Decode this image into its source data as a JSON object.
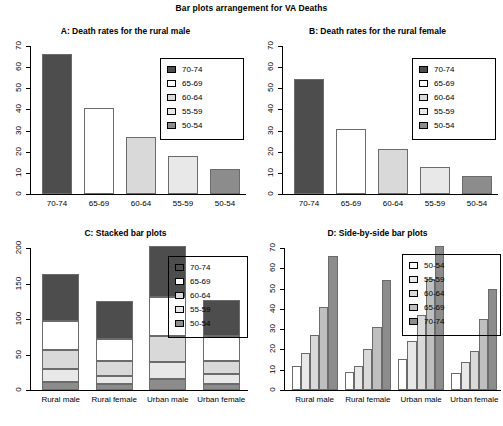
{
  "figure": {
    "title": "Bar plots arrangement for VA Deaths"
  },
  "groups": [
    "Rural male",
    "Rural female",
    "Urban male",
    "Urban female"
  ],
  "age_groups": [
    "70-74",
    "65-69",
    "60-64",
    "55-59",
    "50-54"
  ],
  "colors": {
    "70-74": "#4d4d4d",
    "65-69": "#ffffff",
    "60-64": "#d9d9d9",
    "55-59": "#e8e8e8",
    "50-54": "#8c8c8c",
    "d_50-54": "#ffffff",
    "d_55-59": "#e8e8e8",
    "d_60-64": "#d9d9d9",
    "d_65-69": "#bfbfbf",
    "d_70-74": "#8c8c8c",
    "border": "#6b6b6b",
    "axis": "#000000"
  },
  "panels": {
    "A": {
      "title": "A: Death rates for the rural male",
      "legend_items": [
        "70-74",
        "65-69",
        "60-64",
        "55-59",
        "50-54"
      ]
    },
    "B": {
      "title": "B: Death rates for the rural female",
      "legend_items": [
        "70-74",
        "65-69",
        "60-64",
        "55-59",
        "50-54"
      ]
    },
    "C": {
      "title": "C: Stacked bar plots",
      "legend_items": [
        "70-74",
        "65-69",
        "60-64",
        "55-59",
        "50-54"
      ]
    },
    "D": {
      "title": "D: Side-by-side bar plots",
      "legend_items": [
        "50-54",
        "55-59",
        "60-64",
        "65-69",
        "70-74"
      ]
    }
  },
  "chart_data": [
    {
      "type": "bar",
      "panel": "A",
      "title": "A: Death rates for the rural male",
      "categories": [
        "70-74",
        "65-69",
        "60-64",
        "55-59",
        "50-54"
      ],
      "values": [
        66.0,
        40.7,
        26.9,
        18.1,
        11.7
      ],
      "xlabel": "",
      "ylabel": "",
      "ylim": [
        0,
        70
      ],
      "yticks": [
        0,
        10,
        20,
        30,
        40,
        50,
        60,
        70
      ],
      "grid": false,
      "legend": "top-right"
    },
    {
      "type": "bar",
      "panel": "B",
      "title": "B: Death rates for the rural female",
      "categories": [
        "70-74",
        "65-69",
        "60-64",
        "55-59",
        "50-54"
      ],
      "values": [
        54.3,
        30.9,
        21.1,
        12.7,
        8.7
      ],
      "xlabel": "",
      "ylabel": "",
      "ylim": [
        0,
        70
      ],
      "yticks": [
        0,
        10,
        20,
        30,
        40,
        50,
        60,
        70
      ],
      "grid": false,
      "legend": "top-right"
    },
    {
      "type": "bar",
      "subtype": "stacked",
      "panel": "C",
      "title": "C: Stacked bar plots",
      "categories": [
        "Rural male",
        "Rural female",
        "Urban male",
        "Urban female"
      ],
      "series": [
        {
          "name": "50-54",
          "values": [
            11.7,
            8.7,
            15.4,
            8.4
          ]
        },
        {
          "name": "55-59",
          "values": [
            18.1,
            11.7,
            24.3,
            13.6
          ]
        },
        {
          "name": "60-64",
          "values": [
            26.9,
            20.3,
            37.0,
            19.3
          ]
        },
        {
          "name": "65-69",
          "values": [
            41.0,
            30.9,
            54.6,
            35.1
          ]
        },
        {
          "name": "70-74",
          "values": [
            66.0,
            54.3,
            71.1,
            50.0
          ]
        }
      ],
      "totals": [
        163.7,
        125.9,
        202.4,
        126.4
      ],
      "xlabel": "",
      "ylabel": "",
      "ylim": [
        0,
        200
      ],
      "yticks": [
        0,
        50,
        100,
        150,
        200
      ],
      "grid": false,
      "legend": "center-right"
    },
    {
      "type": "bar",
      "subtype": "grouped",
      "panel": "D",
      "title": "D: Side-by-side bar plots",
      "categories": [
        "Rural male",
        "Rural female",
        "Urban male",
        "Urban female"
      ],
      "series": [
        {
          "name": "50-54",
          "values": [
            11.7,
            8.7,
            15.4,
            8.4
          ]
        },
        {
          "name": "55-59",
          "values": [
            18.1,
            11.7,
            24.3,
            13.6
          ]
        },
        {
          "name": "60-64",
          "values": [
            26.9,
            20.3,
            37.0,
            19.3
          ]
        },
        {
          "name": "65-69",
          "values": [
            41.0,
            30.9,
            54.6,
            35.1
          ]
        },
        {
          "name": "70-74",
          "values": [
            66.0,
            54.3,
            71.1,
            50.0
          ]
        }
      ],
      "xlabel": "",
      "ylabel": "",
      "ylim": [
        0,
        70
      ],
      "yticks": [
        0,
        10,
        20,
        30,
        40,
        50,
        60,
        70
      ],
      "grid": false,
      "legend": "top-right"
    }
  ]
}
